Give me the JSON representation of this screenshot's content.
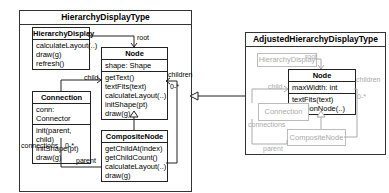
{
  "left_package": {
    "title": "HierarchyDisplayType",
    "classes": {
      "hierarchy_display": {
        "name": "HierarchyDisplay",
        "methods": [
          "calculateLayout(..)",
          "draw(g)",
          "refresh()"
        ]
      },
      "node": {
        "name": "Node",
        "attributes": [
          "shape: Shape"
        ],
        "methods": [
          "getText()",
          "textFits(text)",
          "calculateLayout(..)",
          "initShape(pt)",
          "draw(g)"
        ]
      },
      "connection": {
        "name": "Connection",
        "attributes": [
          "conn: Connector"
        ],
        "methods": [
          "init(parent, child)",
          "initShape(pt)",
          "draw(g)"
        ]
      },
      "composite_node": {
        "name": "CompositeNode",
        "methods": [
          "getChildAt(index)",
          "getChildCount()",
          "calculateLayout(..)",
          "draw(g)"
        ]
      }
    },
    "labels": {
      "root": "root",
      "child": "child",
      "children": "children",
      "children_mult": "0-*",
      "connections": "connections",
      "connections_mult": "0-*",
      "parent": "parent"
    }
  },
  "right_package": {
    "title": "AdjustedHierarchyDisplayType",
    "classes": {
      "hierarchy_display": {
        "name": "HierarchyDisplay"
      },
      "node": {
        "name": "Node",
        "attributes": [
          "maxWidth: int"
        ],
        "methods": [
          "textFits(text)",
          "positionNode(..)"
        ]
      },
      "connection": {
        "name": "Connection"
      },
      "composite_node": {
        "name": "CompositeNode"
      }
    },
    "labels": {
      "root": "root",
      "child": "child",
      "children": "children",
      "children_mult": "0-*",
      "connections": "connections",
      "connections_mult": "0-*",
      "parent": "parent"
    }
  }
}
